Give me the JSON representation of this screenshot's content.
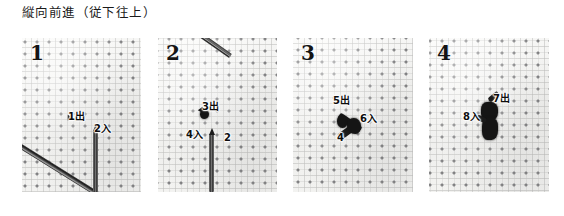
{
  "figure": {
    "title": "縦向前進（従下往上）",
    "panel_count": 4,
    "cloth_color": "#f4f4f2",
    "thread_color": "#151515",
    "needle_color": "#2c2c2c",
    "label_color": "#0d0d0d"
  },
  "panels": [
    {
      "number": "1",
      "callouts": [
        {
          "text": "1出",
          "x": 46,
          "y": 80
        },
        {
          "text": "2入",
          "x": 72,
          "y": 92
        }
      ]
    },
    {
      "number": "2",
      "callouts": [
        {
          "text": "3出",
          "x": 47,
          "y": 72
        },
        {
          "text": "4入",
          "x": 33,
          "y": 100
        },
        {
          "text": "2",
          "x": 68,
          "y": 104
        }
      ]
    },
    {
      "number": "3",
      "callouts": [
        {
          "text": "5出",
          "x": 42,
          "y": 64
        },
        {
          "text": "6入",
          "x": 69,
          "y": 82
        },
        {
          "text": "4",
          "x": 45,
          "y": 100
        }
      ]
    },
    {
      "number": "4",
      "callouts": [
        {
          "text": "7出",
          "x": 66,
          "y": 62
        },
        {
          "text": "8入",
          "x": 39,
          "y": 80
        }
      ]
    }
  ]
}
